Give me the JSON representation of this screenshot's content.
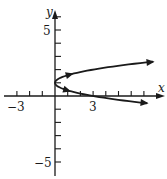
{
  "chart_data": {
    "type": "line",
    "title": "",
    "xlabel": "x",
    "ylabel": "y",
    "x_ticks_labeled": [
      {
        "value": -3,
        "label": "−3"
      },
      {
        "value": 3,
        "label": "3"
      }
    ],
    "y_ticks_labeled": [
      {
        "value": 5,
        "label": "5"
      },
      {
        "value": -5,
        "label": "−5"
      }
    ],
    "x_tick_range": [
      -3,
      7
    ],
    "y_tick_range": [
      -5,
      6
    ],
    "xlim": [
      -4,
      8.5
    ],
    "ylim": [
      -6.2,
      7
    ],
    "grid": false,
    "series": [
      {
        "name": "parabola x = 3(y - 1)^2",
        "description": "Horizontal parabola opening right with vertex at (0, 1); arrows on both branches pointing outward (direction of motion)",
        "vertex": [
          0,
          1
        ],
        "points": [
          [
            7.3,
            -0.55
          ],
          [
            5.3,
            -0.33
          ],
          [
            3.0,
            0.0
          ],
          [
            1.33,
            0.33
          ],
          [
            0.33,
            0.67
          ],
          [
            0,
            1
          ],
          [
            0.33,
            1.33
          ],
          [
            1.33,
            1.67
          ],
          [
            3.0,
            2.0
          ],
          [
            5.3,
            2.33
          ],
          [
            7.7,
            2.6
          ]
        ],
        "arrows": [
          {
            "at": [
              1.3,
              1.66
            ],
            "direction": "away-from-vertex"
          },
          {
            "at": [
              1.2,
              0.37
            ],
            "direction": "toward-vertex-reversed"
          },
          {
            "at": [
              7.7,
              2.6
            ],
            "direction": "end"
          },
          {
            "at": [
              7.3,
              -0.55
            ],
            "direction": "end"
          }
        ]
      }
    ]
  },
  "labels": {
    "x_axis": "x",
    "y_axis": "y",
    "x_neg3": "−3",
    "x_pos3": "3",
    "y_pos5": "5",
    "y_neg5": "−5"
  }
}
